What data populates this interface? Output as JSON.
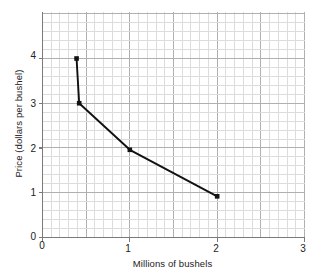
{
  "chart_data": {
    "type": "line",
    "title": "",
    "xlabel": "Millions of bushels",
    "ylabel": "Price (dollars per bushel)",
    "xlim": [
      0,
      3
    ],
    "ylim": [
      0,
      5.05
    ],
    "xticks": [
      "0",
      "1",
      "2",
      "3"
    ],
    "xtick_values": [
      0,
      1,
      2,
      3
    ],
    "yticks": [
      "0",
      "1",
      "2",
      "3",
      "4"
    ],
    "ytick_values": [
      0,
      1,
      2,
      3,
      4
    ],
    "grid": true,
    "grid_minor_step_x": 0.1,
    "grid_minor_step_y": 0.2,
    "grid_major_step_x": 0.5,
    "grid_major_step_y": 1,
    "legend": null,
    "series": [
      {
        "name": "demand curve",
        "marker": "square",
        "color": "#111111",
        "points": [
          {
            "x": 0.39,
            "y": 4.0
          },
          {
            "x": 0.42,
            "y": 3.0
          },
          {
            "x": 1.0,
            "y": 1.96
          },
          {
            "x": 2.0,
            "y": 0.92
          }
        ]
      }
    ],
    "colors": {
      "line": "#111111",
      "marker": "#111111",
      "grid_minor": "#dcdcdc",
      "grid_major": "#b0b0b0",
      "axis": "#7a7a7a",
      "background": "#ffffff",
      "text": "#222222"
    }
  }
}
